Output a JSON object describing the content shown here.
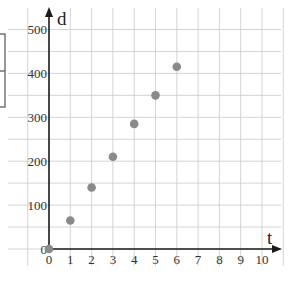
{
  "chart_data": {
    "type": "scatter",
    "title": "",
    "xlabel": "t",
    "ylabel": "d",
    "xlim": [
      0,
      10
    ],
    "ylim": [
      0,
      500
    ],
    "grid": true,
    "x_ticks": [
      0,
      1,
      2,
      3,
      4,
      5,
      6,
      7,
      8,
      9,
      10
    ],
    "x_tick_labels": [
      "0",
      "1",
      "2",
      "3",
      "4",
      "5",
      "6",
      "7",
      "8",
      "9",
      "10"
    ],
    "y_ticks": [
      0,
      100,
      200,
      300,
      400,
      500
    ],
    "y_tick_labels": [
      "0",
      "100",
      "200",
      "300",
      "400",
      "500"
    ],
    "y_grid_step": 50,
    "x_grid_step": 1,
    "series": [
      {
        "name": "d vs t",
        "x": [
          0,
          1,
          2,
          3,
          4,
          5,
          6
        ],
        "y": [
          0,
          65,
          140,
          210,
          285,
          350,
          415
        ],
        "color": "#8a8a8a"
      }
    ],
    "legend": null
  },
  "colors": {
    "grid": "#c9c9c9",
    "axis": "#1a1a1a",
    "point": "#8a8a8a",
    "box": "#6b6b6b"
  }
}
